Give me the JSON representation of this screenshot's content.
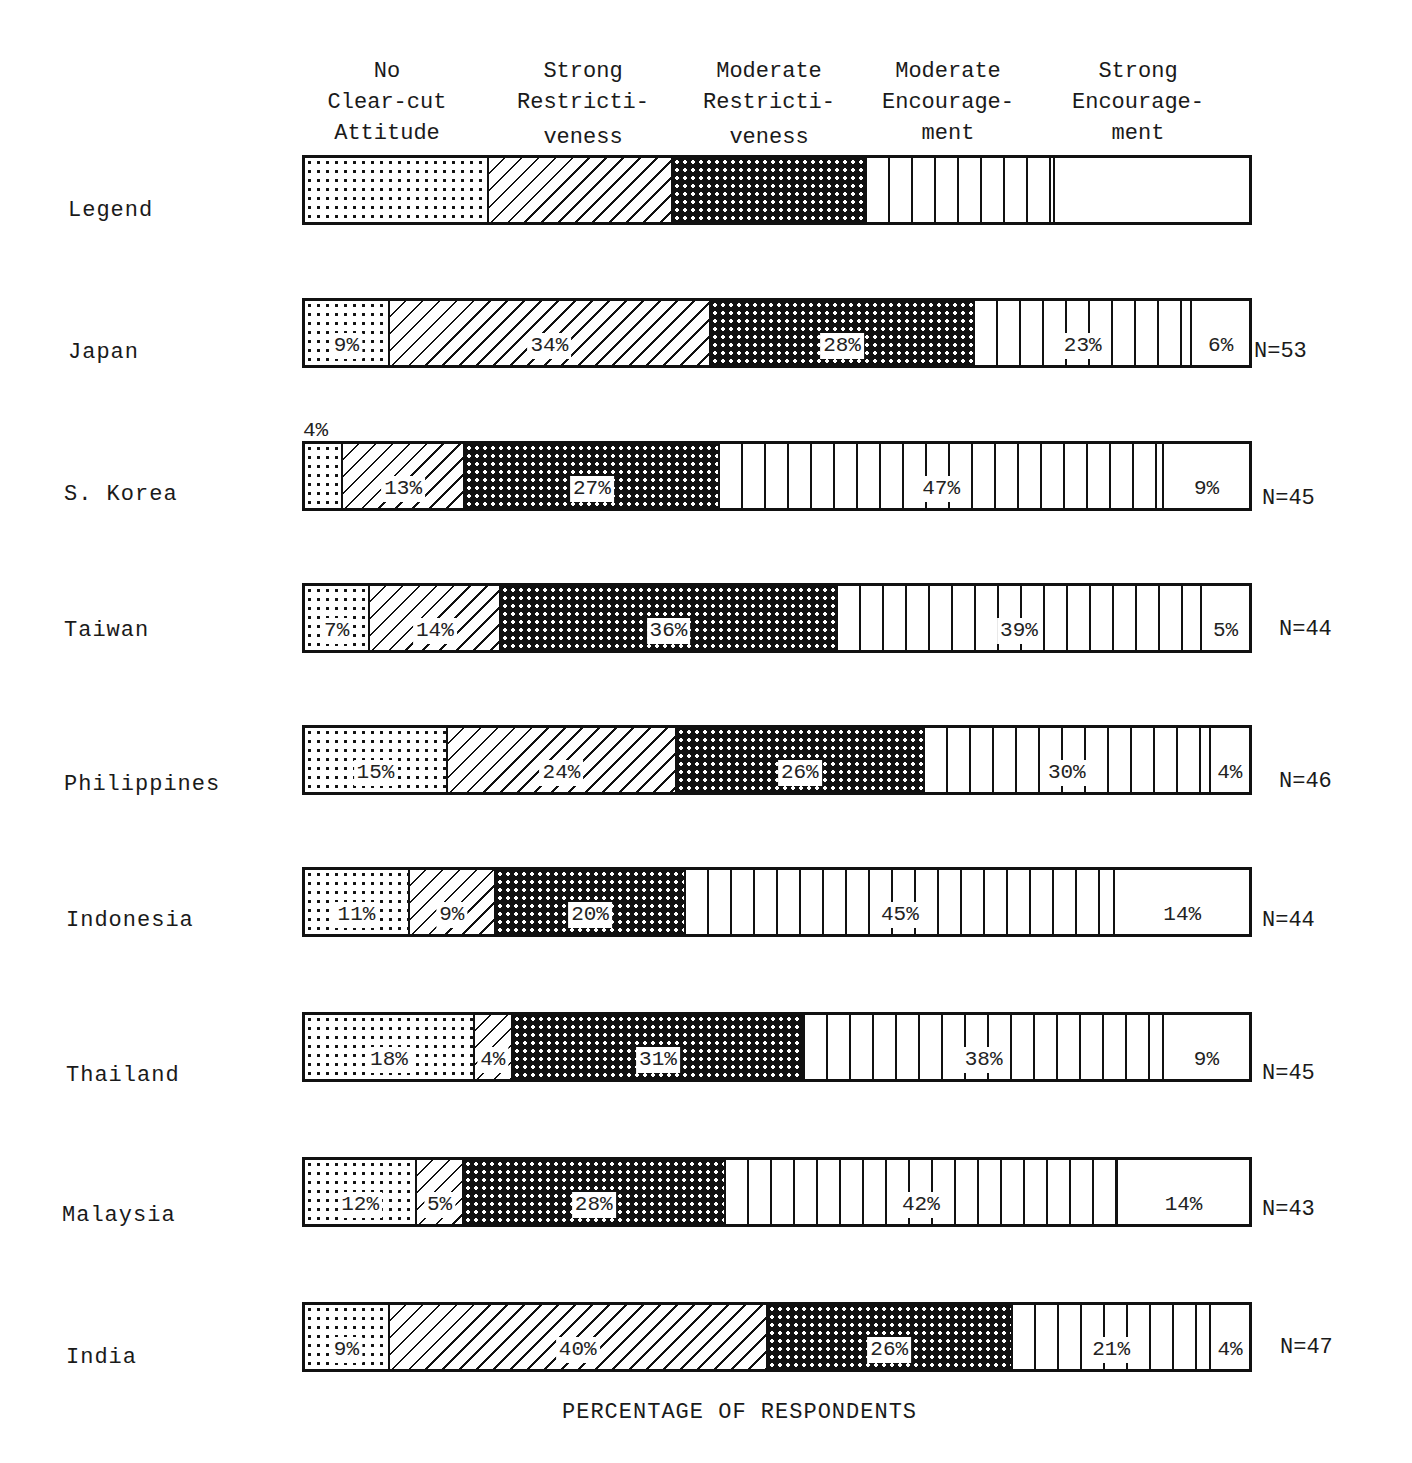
{
  "chart_data": {
    "type": "bar",
    "orientation": "horizontal",
    "stacked": true,
    "title": "",
    "xlabel": "PERCENTAGE OF RESPONDENTS",
    "ylabel": "",
    "xlim": [
      0,
      100
    ],
    "legend_position": "top (as a 'Legend' bar)",
    "categories": [
      "Japan",
      "S. Korea",
      "Taiwan",
      "Philippines",
      "Indonesia",
      "Thailand",
      "Malaysia",
      "India"
    ],
    "series": [
      {
        "name": "No Clear-cut Attitude",
        "pattern": "light-dots",
        "values": [
          9,
          4,
          7,
          15,
          11,
          18,
          12,
          9
        ]
      },
      {
        "name": "Strong Restrictiveness",
        "pattern": "diagonal-hatch",
        "values": [
          34,
          13,
          14,
          24,
          9,
          4,
          5,
          40
        ]
      },
      {
        "name": "Moderate Restrictiveness",
        "pattern": "dark-dots",
        "values": [
          28,
          27,
          36,
          26,
          20,
          31,
          28,
          26
        ]
      },
      {
        "name": "Moderate Encouragement",
        "pattern": "vertical-lines",
        "values": [
          23,
          47,
          39,
          30,
          45,
          38,
          42,
          21
        ]
      },
      {
        "name": "Strong Encouragement",
        "pattern": "blank",
        "values": [
          6,
          9,
          5,
          4,
          14,
          9,
          14,
          4
        ]
      }
    ],
    "sample_sizes": {
      "Japan": 53,
      "S. Korea": 45,
      "Taiwan": 44,
      "Philippines": 46,
      "Indonesia": 44,
      "Thailand": 45,
      "Malaysia": 43,
      "India": 47
    },
    "grid": false
  },
  "legend": {
    "row_label": "Legend",
    "headers": [
      {
        "line1": "No",
        "line2": "Clear-cut",
        "line3": "Attitude"
      },
      {
        "line1": "Strong",
        "line2": "Restricti-",
        "line3": "veness"
      },
      {
        "line1": "Moderate",
        "line2": "Restricti-",
        "line3": "veness"
      },
      {
        "line1": "Moderate",
        "line2": "Encourage-",
        "line3": "ment"
      },
      {
        "line1": "Strong",
        "line2": "Encourage-",
        "line3": "ment"
      }
    ]
  },
  "rows": [
    {
      "country": "Japan",
      "n": "N=53",
      "labels": [
        "9%",
        "34%",
        "28%",
        "23%",
        "6%"
      ]
    },
    {
      "country": "S. Korea",
      "n": "N=45",
      "labels": [
        "",
        "13%",
        "27%",
        "47%",
        "9%"
      ],
      "above": "4%"
    },
    {
      "country": "Taiwan",
      "n": "N=44",
      "labels": [
        "7%",
        "14%",
        "36%",
        "39%",
        "5%"
      ]
    },
    {
      "country": "Philippines",
      "n": "N=46",
      "labels": [
        "15%",
        "24%",
        "26%",
        "30%",
        "4%"
      ]
    },
    {
      "country": "Indonesia",
      "n": "N=44",
      "labels": [
        "11%",
        "9%",
        "20%",
        "45%",
        "14%"
      ]
    },
    {
      "country": "Thailand",
      "n": "N=45",
      "labels": [
        "18%",
        "4%",
        "31%",
        "38%",
        "9%"
      ]
    },
    {
      "country": "Malaysia",
      "n": "N=43",
      "labels": [
        "12%",
        "5%",
        "28%",
        "42%",
        "14%"
      ]
    },
    {
      "country": "India",
      "n": "N=47",
      "labels": [
        "9%",
        "40%",
        "26%",
        "21%",
        "4%"
      ]
    }
  ]
}
